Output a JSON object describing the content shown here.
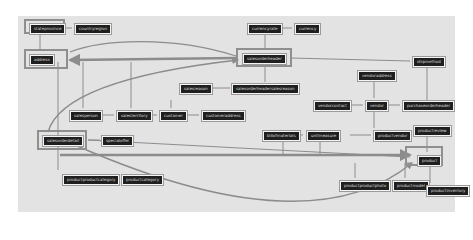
{
  "diagram": {
    "type": "database-schema-graph",
    "colors": {
      "background": "#e3e3e3",
      "node_fill": "#1f1f1f",
      "node_text": "#dcdcdc",
      "edge": "#8c8c8c",
      "highlight": "#8f8f8f"
    },
    "nodes": [
      {
        "id": "stateprovince",
        "label": "stateprovince",
        "x": 30,
        "y": 24,
        "highlight": true
      },
      {
        "id": "countryregion",
        "label": "countryregion",
        "x": 75,
        "y": 24
      },
      {
        "id": "address",
        "label": "address",
        "x": 30,
        "y": 55,
        "highlight": true
      },
      {
        "id": "currencyrate",
        "label": "currencyrate",
        "x": 248,
        "y": 24
      },
      {
        "id": "currency",
        "label": "currency",
        "x": 295,
        "y": 24
      },
      {
        "id": "salesorderheader",
        "label": "salesorderheader",
        "x": 243,
        "y": 54,
        "highlight": true
      },
      {
        "id": "shipmethod",
        "label": "shipmethod",
        "x": 413,
        "y": 57
      },
      {
        "id": "salesreason",
        "label": "salesreason",
        "x": 180,
        "y": 84
      },
      {
        "id": "salesorderheadersalesreason",
        "label": "salesorderheadersalesreason",
        "x": 232,
        "y": 84
      },
      {
        "id": "vendoraddress",
        "label": "vendoraddress",
        "x": 358,
        "y": 71
      },
      {
        "id": "salesperson",
        "label": "salesperson",
        "x": 70,
        "y": 111
      },
      {
        "id": "salesterritory",
        "label": "salesterritory",
        "x": 117,
        "y": 111
      },
      {
        "id": "customer",
        "label": "customer",
        "x": 160,
        "y": 111
      },
      {
        "id": "customeraddress",
        "label": "customeraddress",
        "x": 202,
        "y": 111
      },
      {
        "id": "vendorcontact",
        "label": "vendorcontact",
        "x": 314,
        "y": 101
      },
      {
        "id": "vendor",
        "label": "vendor",
        "x": 366,
        "y": 101
      },
      {
        "id": "purchaseorderheader",
        "label": "purchaseorderheader",
        "x": 403,
        "y": 101
      },
      {
        "id": "salesorderdetail",
        "label": "salesorderdetail",
        "x": 43,
        "y": 136,
        "highlight": true
      },
      {
        "id": "specialoffer",
        "label": "specialoffer",
        "x": 102,
        "y": 136
      },
      {
        "id": "billofmaterials",
        "label": "billofmaterials",
        "x": 263,
        "y": 131
      },
      {
        "id": "unitmeasure",
        "label": "unitmeasure",
        "x": 307,
        "y": 131
      },
      {
        "id": "productvendor",
        "label": "productvendor",
        "x": 374,
        "y": 131
      },
      {
        "id": "productreview",
        "label": "productreview",
        "x": 414,
        "y": 126
      },
      {
        "id": "product",
        "label": "product",
        "x": 418,
        "y": 156,
        "highlight": true
      },
      {
        "id": "productproductcategory",
        "label": "productproductcategory",
        "x": 63,
        "y": 175
      },
      {
        "id": "productcategory",
        "label": "productcategory",
        "x": 122,
        "y": 175
      },
      {
        "id": "productproductphoto",
        "label": "productproductphoto",
        "x": 340,
        "y": 181
      },
      {
        "id": "productmodel",
        "label": "productmodel",
        "x": 393,
        "y": 181
      },
      {
        "id": "productinventory",
        "label": "productinventory",
        "x": 427,
        "y": 186
      }
    ],
    "edges": [
      [
        "stateprovince",
        "countryregion"
      ],
      [
        "address",
        "stateprovince"
      ],
      [
        "currencyrate",
        "currency"
      ],
      [
        "salesorderheader",
        "currencyrate"
      ],
      [
        "salesorderheader",
        "address"
      ],
      [
        "salesorderheader",
        "shipmethod"
      ],
      [
        "salesorderheadersalesreason",
        "salesorderheader"
      ],
      [
        "salesorderheadersalesreason",
        "salesreason"
      ],
      [
        "salesperson",
        "salesterritory"
      ],
      [
        "customer",
        "salesterritory"
      ],
      [
        "customeraddress",
        "customer"
      ],
      [
        "vendorcontact",
        "vendor"
      ],
      [
        "purchaseorderheader",
        "vendor"
      ],
      [
        "vendoraddress",
        "vendor"
      ],
      [
        "productvendor",
        "vendor"
      ],
      [
        "productvendor",
        "unitmeasure"
      ],
      [
        "billofmaterials",
        "unitmeasure"
      ],
      [
        "salesorderdetail",
        "specialoffer"
      ],
      [
        "salesorderdetail",
        "salesorderheader"
      ],
      [
        "salesorderdetail",
        "product"
      ],
      [
        "productproductcategory",
        "productcategory"
      ],
      [
        "productreview",
        "product"
      ],
      [
        "productproductphoto",
        "product"
      ],
      [
        "productmodel",
        "product"
      ],
      [
        "productinventory",
        "product"
      ]
    ]
  }
}
